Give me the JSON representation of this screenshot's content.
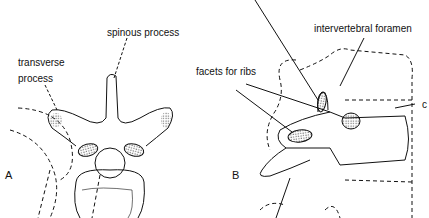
{
  "figure": {
    "panels": [
      {
        "id": "A",
        "label": "A",
        "view": "superior view of thoracic vertebra"
      },
      {
        "id": "B",
        "label": "B",
        "view": "lateral view of thoracic vertebra"
      }
    ],
    "labels": {
      "spinous_process": "spinous process",
      "transverse_process_line1": "transverse",
      "transverse_process_line2": "process",
      "intervertebral_foramen": "intervertebral foramen",
      "facets_for_ribs": "facets for ribs",
      "cut_off_label": "c"
    },
    "colors": {
      "line": "#111111",
      "background": "#ffffff",
      "stipple": "#555555"
    }
  }
}
